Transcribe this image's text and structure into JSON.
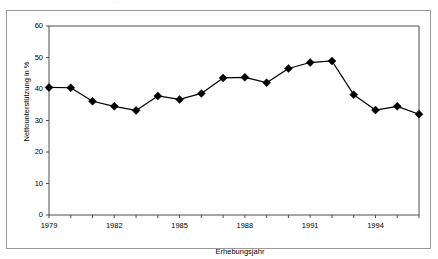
{
  "figure": {
    "scan_artifact": "…",
    "background_color": "#ffffff",
    "frame_color": "#9a9a9a",
    "series_color": "#000000"
  },
  "chart_data": {
    "type": "line",
    "title": "",
    "xlabel": "Erhebungsjahr",
    "ylabel": "Nettounterstützung in %",
    "x": [
      1979,
      1980,
      1981,
      1982,
      1983,
      1984,
      1985,
      1986,
      1987,
      1988,
      1989,
      1990,
      1991,
      1992,
      1993,
      1994,
      1995,
      1996
    ],
    "values": [
      40.5,
      40.4,
      36.1,
      34.5,
      33.2,
      37.8,
      36.7,
      38.6,
      43.5,
      43.7,
      42.0,
      46.5,
      48.4,
      48.9,
      38.2,
      33.3,
      34.5,
      32.0
    ],
    "series": [
      {
        "name": "Nettounterstützung",
        "values": [
          40.5,
          40.4,
          36.1,
          34.5,
          33.2,
          37.8,
          36.7,
          38.6,
          43.5,
          43.7,
          42.0,
          46.5,
          48.4,
          48.9,
          38.2,
          33.3,
          34.5,
          32.0
        ]
      }
    ],
    "ylim": [
      0,
      60
    ],
    "yticks": [
      0,
      10,
      20,
      30,
      40,
      50,
      60
    ],
    "ytick_labels": [
      "0",
      "10",
      "20",
      "30",
      "40",
      "50",
      "60"
    ],
    "xlim": [
      1979,
      1996
    ],
    "xticks": [
      1979,
      1982,
      1985,
      1988,
      1991,
      1994
    ],
    "xtick_labels": [
      "1979",
      "1982",
      "1985",
      "1988",
      "1991",
      "1994"
    ],
    "xtick_minor_all_years": true,
    "grid": false,
    "legend": null,
    "marker": "diamond",
    "marker_size": 4,
    "line_width": 1.2
  }
}
